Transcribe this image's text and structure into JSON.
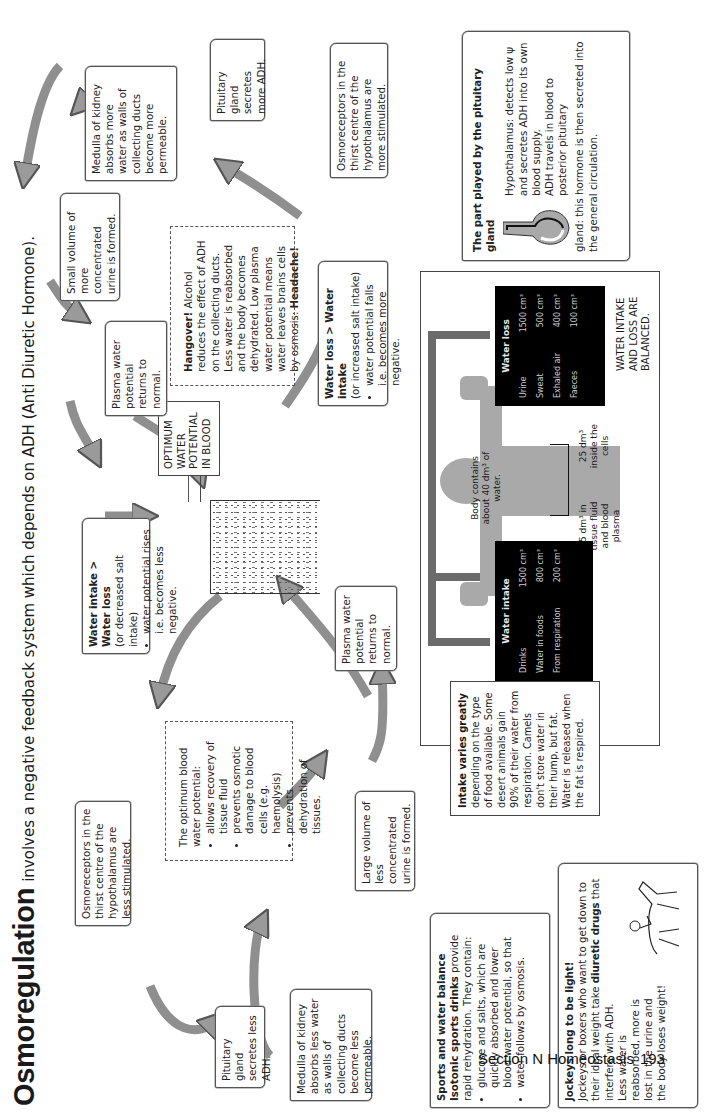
{
  "title": {
    "main": "Osmoregulation",
    "subtitle": "involves a negative feedback system which depends on ADH (Anti Diuretic Hormone)."
  },
  "center": {
    "label": "OPTIMUM WATER POTENTIAL IN BLOOD",
    "label_lines": [
      "OPTIMUM",
      "WATER",
      "POTENTIAL",
      "IN BLOOD"
    ]
  },
  "upper_loop": {
    "trigger": {
      "heading": "Water loss > Water intake",
      "sub": "(or increased salt intake)",
      "bullet": "water potential falls i.e. becomes more negative."
    },
    "osmoreceptors": "Osmoreceptors in the thirst centre of the hypothalamus are more stimulated.",
    "pituitary": "Pituitary gland secretes more ADH.",
    "medulla": "Medulla of kidney absorbs more water as walls of collecting ducts become more permeable.",
    "urine": "Small volume of more concentrated urine is formed.",
    "plasma": "Plasma water potential returns to normal."
  },
  "lower_loop": {
    "trigger": {
      "heading": "Water intake > Water loss",
      "sub": "(or decreased salt intake)",
      "bullet": "water potential rises i.e. becomes less negative."
    },
    "osmoreceptors": "Osmoreceptors in the thirst centre of the hypothalamus are less stimulated.",
    "pituitary": "Pituitary gland secretes less ADH.",
    "medulla": "Medulla of kidney absorbs less water as walls of collecting ducts become less permeable.",
    "urine": "Large volume of less concentrated urine is formed.",
    "plasma": "Plasma water potential returns to normal."
  },
  "hangover": {
    "heading": "Hangover!",
    "text": "Alcohol reduces the effect of ADH on the collecting ducts. Less water is reabsorbed and the body becomes dehydrated. Low plasma water potential means water leaves brains cells by osmosis:",
    "end": "Headache!"
  },
  "optimum_benefits": {
    "intro": "The optimum blood water potential:",
    "bullets": [
      "allows recovery of tissue fluid",
      "prevents osmotic damage to blood cells (e.g. haemolysis)",
      "prevents dehydration of tissues."
    ]
  },
  "balance": {
    "body_label": "Body contains about 40 dm³ of water.",
    "tissue_label": "15 dm³ in tissue fluid and blood plasma",
    "cells_label": "25 dm³ inside the cells",
    "balanced_label": "WATER INTAKE AND LOSS ARE BALANCED.",
    "water_intake": {
      "heading": "Water intake",
      "rows": [
        {
          "label": "Drinks",
          "value": "1500 cm³"
        },
        {
          "label": "Water in foods",
          "value": "800 cm³"
        },
        {
          "label": "From respiration",
          "value": "200 cm³"
        }
      ]
    },
    "water_loss": {
      "heading": "Water loss",
      "rows": [
        {
          "label": "Urine",
          "value": "1500 cm³"
        },
        {
          "label": "Sweat",
          "value": "500 cm³"
        },
        {
          "label": "Exhaled air",
          "value": "400 cm³"
        },
        {
          "label": "Faeces",
          "value": "100 cm³"
        }
      ]
    },
    "intake_note": {
      "heading": "Intake varies greatly",
      "text": "depending on the type of food available. Some desert animals gain 90% of their water from respiration. Camels don't store water in their hump, but fat. Water is released when the fat is respired."
    }
  },
  "pituitary_box": {
    "heading": "The part played by the pituitary gland",
    "hypothalamus": "Hypothalamus: detects low ψ and secretes ADH into its own blood supply.",
    "travel": "ADH travels in blood to posterior pituitary",
    "gland": "gland: this hormone is then secreted into the general circulation."
  },
  "sports": {
    "heading": "Sports and water balance",
    "lead_bold": "Isotonic sports drinks",
    "lead": "provide rapid rehydration. They contain:",
    "bullets": [
      "glucose and salts, which are quickly absorbed and lower blood water potential, so that",
      "water follows by osmosis."
    ]
  },
  "jockeys": {
    "heading": "Jockeys long to be light!",
    "text1": "Jockeys or boxers who want to get down to their ideal weight take",
    "bold": "diuretic drugs",
    "text2": "that interfere with ADH.",
    "text3": "Less water is reabsorbed, more is lost in the urine and the body loses weight!"
  },
  "footer": {
    "section": "Section N Homeostasis",
    "page": "193"
  },
  "colors": {
    "arrow_fill": "#9a9a9a",
    "arrow_stroke": "#555555",
    "body_grey": "#a9a9a9",
    "bar": "#6b6b6b",
    "panel_black": "#000000"
  }
}
